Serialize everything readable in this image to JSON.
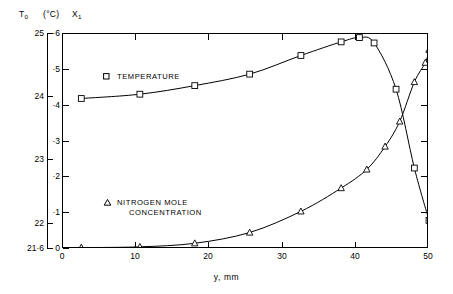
{
  "header": {
    "left_axis_symbol": "T",
    "left_axis_symbol_sub": "0",
    "left_axis_unit": "(°C)",
    "inner_axis_symbol": "X",
    "inner_axis_symbol_sub": "1"
  },
  "legend": {
    "temperature_label": "TEMPERATURE",
    "temperature_marker": "square-marker",
    "nitrogen_label_line1": "NITROGEN  MOLE",
    "nitrogen_label_line2": "CONCENTRATION",
    "nitrogen_marker": "triangle-marker"
  },
  "axes": {
    "xlabel": "y, mm",
    "x_ticks": [
      "0",
      "10",
      "20",
      "30",
      "40",
      "50"
    ],
    "left_ticks": [
      "25",
      "24",
      "23",
      "22",
      "21·6"
    ],
    "inner_ticks": [
      "·6",
      "·5",
      "·4",
      "·3",
      "·2",
      "·1",
      "0"
    ]
  },
  "chart_data": {
    "type": "line",
    "title": "",
    "xlabel": "y, mm",
    "ylabel": "X₁",
    "ylabel_secondary": "T₀ (°C)",
    "xlim": [
      0,
      50
    ],
    "ylim": [
      0,
      0.6
    ],
    "ylim_secondary": [
      21.6,
      25.0
    ],
    "grid": false,
    "legend_position": "inside-left",
    "x_ticks": [
      0,
      10,
      20,
      30,
      40,
      50
    ],
    "y_ticks": [
      0,
      0.1,
      0.2,
      0.3,
      0.4,
      0.5,
      0.6
    ],
    "y_ticks_secondary": [
      21.6,
      22,
      23,
      24,
      25
    ],
    "series": [
      {
        "name": "TEMPERATURE",
        "marker": "square",
        "axis": "secondary",
        "x": [
          2.5,
          10.5,
          18.0,
          25.5,
          32.5,
          38.0,
          40.5,
          42.5,
          45.5,
          48.0,
          50.0
        ],
        "values": [
          0.42,
          0.432,
          0.456,
          0.488,
          0.54,
          0.578,
          0.59,
          0.575,
          0.446,
          0.226,
          0.08
        ],
        "values_celsius": [
          24.0,
          24.05,
          24.18,
          24.37,
          24.66,
          24.88,
          24.94,
          24.86,
          24.13,
          22.88,
          22.05
        ]
      },
      {
        "name": "NITROGEN MOLE CONCENTRATION",
        "marker": "triangle",
        "axis": "primary",
        "x": [
          2.5,
          10.5,
          18.0,
          25.5,
          32.5,
          38.0,
          41.5,
          44.0,
          46.0,
          48.0,
          49.5,
          50.0
        ],
        "values": [
          0.004,
          0.006,
          0.016,
          0.046,
          0.105,
          0.17,
          0.222,
          0.286,
          0.356,
          0.466,
          0.52,
          0.556
        ]
      }
    ]
  }
}
